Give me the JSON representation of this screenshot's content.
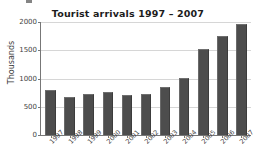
{
  "chart_data": {
    "type": "bar",
    "title": "Tourist arrivals 1997 – 2007",
    "xlabel": "",
    "ylabel": "Thousands",
    "categories": [
      "1997",
      "1998",
      "1999",
      "2000",
      "2001",
      "2002",
      "2003",
      "2004",
      "2005",
      "2006",
      "2007"
    ],
    "values": [
      790,
      670,
      730,
      770,
      715,
      725,
      855,
      1010,
      1520,
      1750,
      1970
    ],
    "ylim": [
      0,
      2000
    ],
    "yticks": [
      0,
      500,
      1000,
      1500,
      2000
    ],
    "ytick_labels": [
      "0",
      "500",
      "1000",
      "1500",
      "2000"
    ],
    "grid": true,
    "legend": "none",
    "bar_color": "#4d4d4d",
    "gridline_color": "#d6d6d6",
    "axis_color": "#777777",
    "background_color": "#ffffff"
  }
}
